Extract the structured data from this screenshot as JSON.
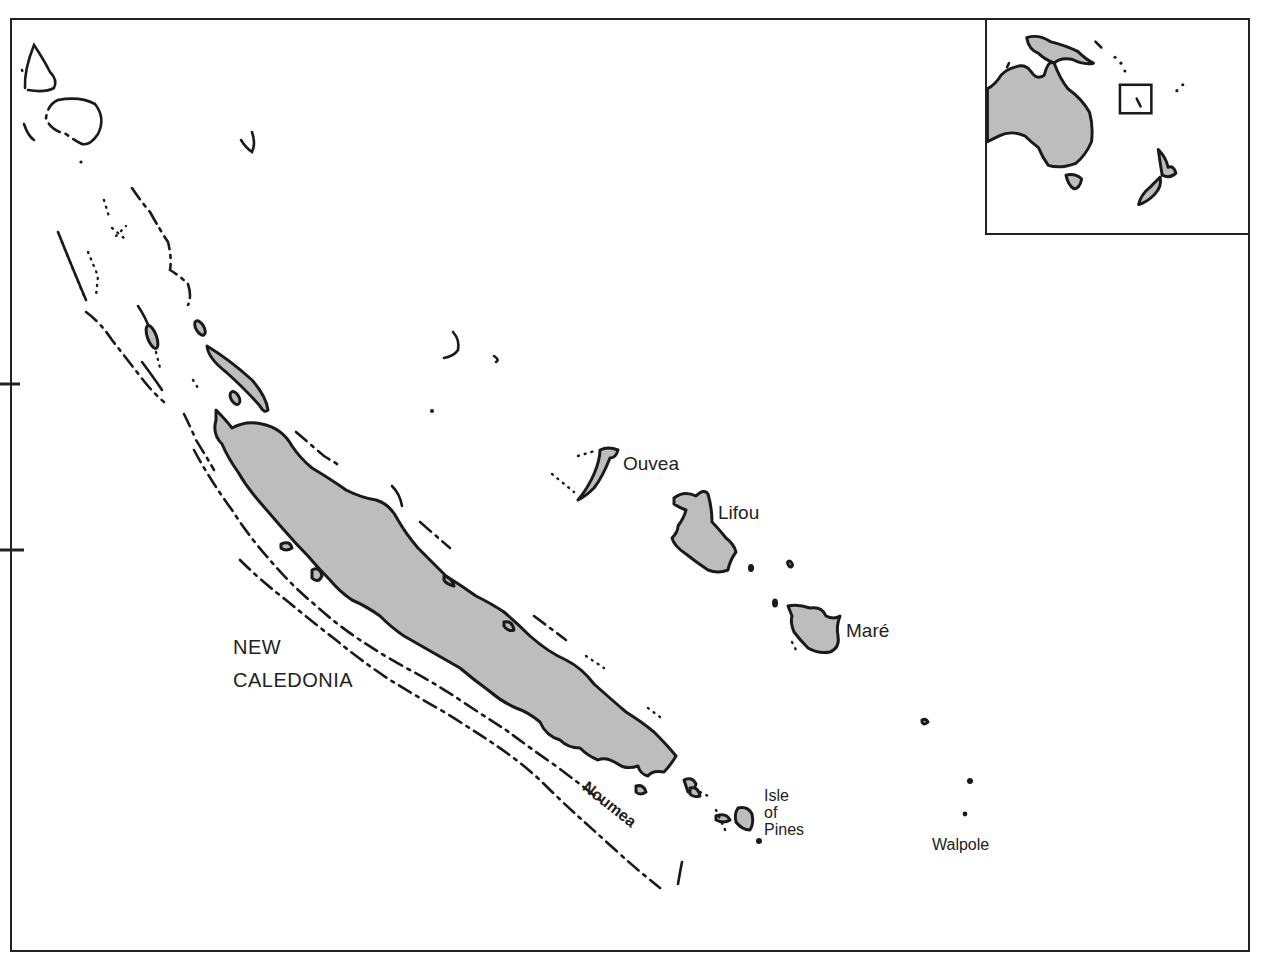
{
  "map": {
    "title": "NEW CALEDONIA",
    "title_lines": [
      "NEW",
      "CALEDONIA"
    ],
    "fill_color": "#bdbdbd",
    "outline_color": "#1a1a1a",
    "background": "#ffffff"
  },
  "labels": {
    "country_line1": "NEW",
    "country_line2": "CALEDONIA",
    "ouvea": "Ouvea",
    "lifou": "Lifou",
    "mare": "Maré",
    "noumea": "Noumea",
    "isle_of_pines_1": "Isle",
    "isle_of_pines_2": "of",
    "isle_of_pines_3": "Pines",
    "walpole": "Walpole"
  },
  "inset": {
    "description": "Locator map: Australia, New Guinea, New Zealand with box marking New Caledonia",
    "features": [
      "Australia",
      "New Guinea",
      "New Zealand",
      "Tasmania",
      "locator-box"
    ]
  },
  "frame": {
    "left_ticks": 2
  }
}
